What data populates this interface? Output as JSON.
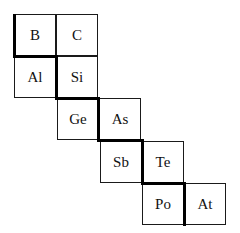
{
  "diagram": {
    "type": "periodic-table-fragment",
    "cells": [
      {
        "symbol": "B",
        "row": 0,
        "col": 0
      },
      {
        "symbol": "C",
        "row": 0,
        "col": 1
      },
      {
        "symbol": "Al",
        "row": 1,
        "col": 0
      },
      {
        "symbol": "Si",
        "row": 1,
        "col": 1
      },
      {
        "symbol": "Ge",
        "row": 2,
        "col": 1
      },
      {
        "symbol": "As",
        "row": 2,
        "col": 2
      },
      {
        "symbol": "Sb",
        "row": 3,
        "col": 2
      },
      {
        "symbol": "Te",
        "row": 3,
        "col": 3
      },
      {
        "symbol": "Po",
        "row": 4,
        "col": 3
      },
      {
        "symbol": "At",
        "row": 4,
        "col": 4
      }
    ],
    "colors": {
      "line": "#000000",
      "background": "#ffffff"
    }
  }
}
